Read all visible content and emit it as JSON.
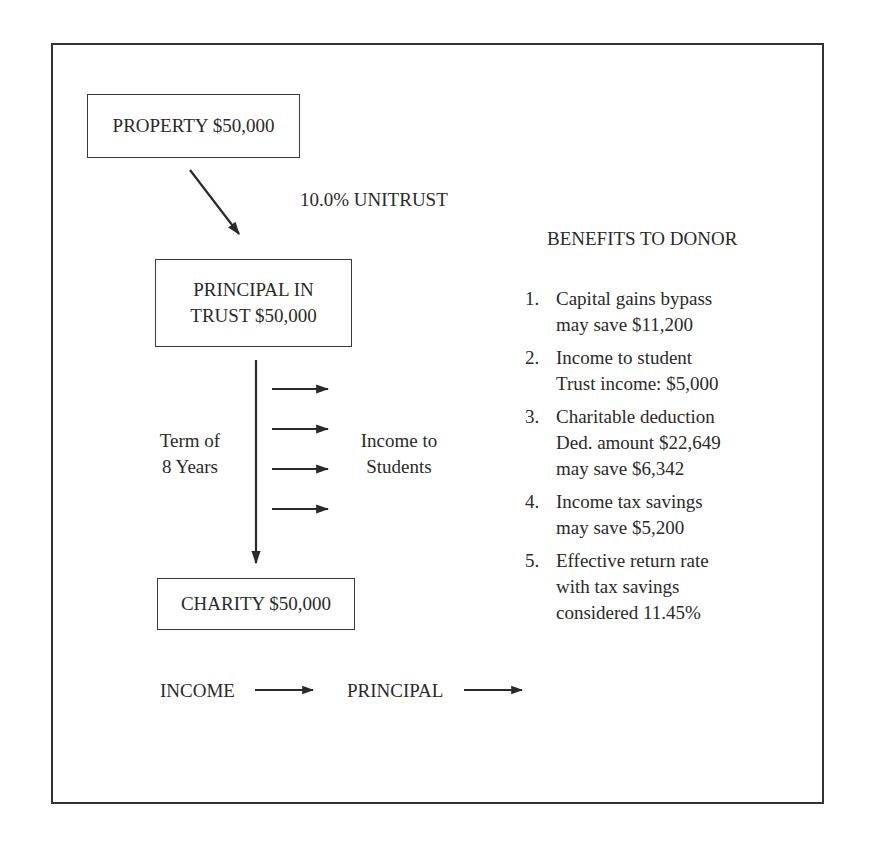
{
  "diagram": {
    "property_box": "PROPERTY $50,000",
    "trust_type": "10.0% UNITRUST",
    "principal_box": {
      "line1": "PRINCIPAL IN",
      "line2": "TRUST $50,000"
    },
    "term_label": {
      "line1": "Term of",
      "line2": "8 Years"
    },
    "income_label": {
      "line1": "Income to",
      "line2": "Students"
    },
    "charity_box": "CHARITY $50,000",
    "legend": {
      "income": "INCOME",
      "principal": "PRINCIPAL"
    }
  },
  "benefits": {
    "heading": "BENEFITS TO DONOR",
    "items": [
      {
        "num": "1.",
        "lines": [
          "Capital gains bypass",
          "may save $11,200"
        ]
      },
      {
        "num": "2.",
        "lines": [
          "Income to student",
          "Trust income: $5,000"
        ]
      },
      {
        "num": "3.",
        "lines": [
          "Charitable deduction",
          "Ded. amount $22,649",
          "may save $6,342"
        ]
      },
      {
        "num": "4.",
        "lines": [
          "Income tax savings",
          "may save $5,200"
        ]
      },
      {
        "num": "5.",
        "lines": [
          "Effective return rate",
          "with tax savings",
          "considered 11.45%"
        ]
      }
    ]
  },
  "colors": {
    "ink": "#2a2a2a",
    "background": "#ffffff"
  }
}
